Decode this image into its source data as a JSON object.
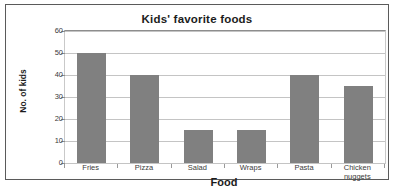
{
  "chart_data": {
    "type": "bar",
    "title": "Kids' favorite foods",
    "xlabel": "Food",
    "ylabel": "No. of kids",
    "categories": [
      "Fries",
      "Pizza",
      "Salad",
      "Wraps",
      "Pasta",
      "Chicken nuggets"
    ],
    "values": [
      50,
      40,
      15,
      15,
      40,
      35
    ],
    "ylim": [
      0,
      60
    ],
    "yticks": [
      0,
      10,
      20,
      30,
      40,
      50,
      60
    ],
    "ytick_labels": [
      "0",
      "10",
      "20",
      "30",
      "40",
      "50",
      "60"
    ],
    "grid": true,
    "legend": false,
    "series": [
      {
        "name": "No. of kids",
        "color": "#808080",
        "values": [
          50,
          40,
          15,
          15,
          40,
          35
        ]
      }
    ]
  },
  "colors": {
    "bar_fill": "#808080",
    "gridline": "#c4c4c4",
    "frame": "#5a5a5a",
    "text": "#1c1c1c"
  }
}
